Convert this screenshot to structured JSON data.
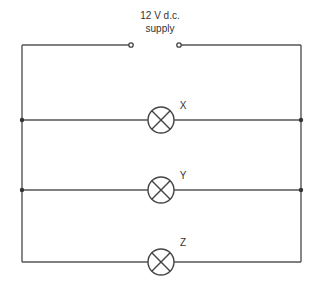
{
  "diagram": {
    "type": "circuit",
    "supply": {
      "line1": "12 V d.c.",
      "line2": "supply"
    },
    "lamps": [
      {
        "label": "X"
      },
      {
        "label": "Y"
      },
      {
        "label": "Z"
      }
    ],
    "wire_color": "#555555"
  }
}
